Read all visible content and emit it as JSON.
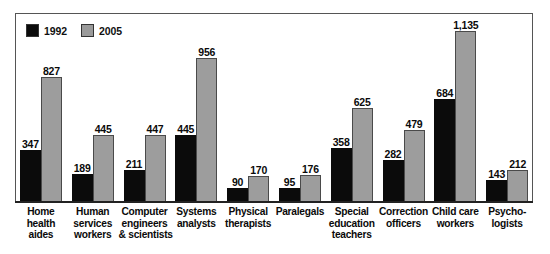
{
  "chart_data": {
    "type": "bar",
    "title": "",
    "xlabel": "",
    "ylabel": "",
    "ylim": [
      0,
      1135
    ],
    "grid": false,
    "legend_position": "top-left",
    "categories": [
      "Home health aides",
      "Human services workers",
      "Computer engineers & scientists",
      "Systems analysts",
      "Physical therapists",
      "Paralegals",
      "Special education teachers",
      "Correction officers",
      "Child care workers",
      "Psychologists"
    ],
    "category_lines": [
      [
        "Home",
        "health",
        "aides"
      ],
      [
        "Human",
        "services",
        "workers"
      ],
      [
        "Computer",
        "engineers",
        "& scientists"
      ],
      [
        "Systems",
        "analysts"
      ],
      [
        "Physical",
        "therapists"
      ],
      [
        "Paralegals"
      ],
      [
        "Special",
        "education",
        "teachers"
      ],
      [
        "Correction",
        "officers"
      ],
      [
        "Child care",
        "workers"
      ],
      [
        "Psycho-",
        "logists"
      ]
    ],
    "series": [
      {
        "name": "1992",
        "color": "#0b0b0b",
        "values": [
          347,
          189,
          211,
          445,
          90,
          95,
          358,
          282,
          684,
          143
        ],
        "labels": [
          "347",
          "189",
          "211",
          "445",
          "90",
          "95",
          "358",
          "282",
          "684",
          "143"
        ]
      },
      {
        "name": "2005",
        "color": "#9d9d9d",
        "values": [
          827,
          445,
          447,
          956,
          170,
          176,
          625,
          479,
          1135,
          212
        ],
        "labels": [
          "827",
          "445",
          "447",
          "956",
          "170",
          "176",
          "625",
          "479",
          "1,135",
          "212"
        ]
      }
    ]
  },
  "legend": {
    "items": [
      {
        "label": "1992",
        "swatch": "black-swatch"
      },
      {
        "label": "2005",
        "swatch": "gray-swatch"
      }
    ]
  }
}
